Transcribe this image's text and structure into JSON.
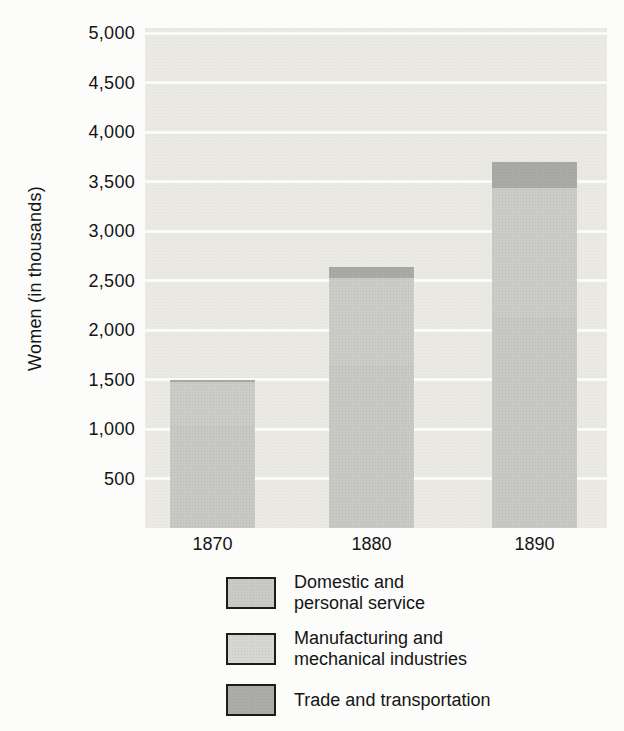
{
  "chart_data": {
    "type": "bar",
    "stacked": true,
    "title": "",
    "xlabel": "",
    "ylabel": "Women (in thousands)",
    "ylim": [
      0,
      5000
    ],
    "ytick_step": 500,
    "grid": "horizontal-white-on-gray",
    "legend_position": "below",
    "categories": [
      "1870",
      "1880",
      "1890"
    ],
    "yticks": [
      {
        "value": 5000,
        "label": "5,000"
      },
      {
        "value": 4500,
        "label": "4,500"
      },
      {
        "value": 4000,
        "label": "4,000"
      },
      {
        "value": 3500,
        "label": "3,500"
      },
      {
        "value": 3000,
        "label": "3,000"
      },
      {
        "value": 2500,
        "label": "2,500"
      },
      {
        "value": 2000,
        "label": "2,000"
      },
      {
        "value": 1500,
        "label": "1,500"
      },
      {
        "value": 1000,
        "label": "1,000"
      },
      {
        "value": 500,
        "label": "500"
      }
    ],
    "series": [
      {
        "name": "Domestic and personal service",
        "color": "#c8c9c4",
        "values": [
          1030,
          1645,
          2130
        ]
      },
      {
        "name": "Manufacturing and mechanical industries",
        "color": "#cbccc7",
        "values": [
          440,
          885,
          1300
        ]
      },
      {
        "name": "Trade and transportation",
        "color": "#a9aaa5",
        "values": [
          30,
          110,
          270
        ]
      }
    ],
    "totals": [
      1500,
      2640,
      3700
    ],
    "note": "Values read from gridlines; the printed boundary between the first two segments is not visually distinguishable, so their individual values are estimates within the measured combined heights of 1470, 2530 and 3430."
  },
  "legend": {
    "items": [
      {
        "label": "Domestic and\npersonal service",
        "color": "#c9cac5"
      },
      {
        "label": "Manufacturing and\nmechanical industries",
        "color": "#d6d7d2"
      },
      {
        "label": "Trade and transportation",
        "color": "#abaca7"
      }
    ]
  },
  "colors": {
    "page_background": "#fcfcfa",
    "plot_background": "#eae9e4",
    "gridline": "#fbfbf8",
    "text": "#141414",
    "swatch_border": "#1c1c1c"
  }
}
